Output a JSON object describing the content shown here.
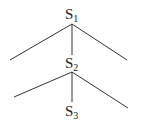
{
  "diagram": {
    "type": "tree",
    "nodes": [
      {
        "id": "S1",
        "base": "S",
        "sub": "1"
      },
      {
        "id": "S2",
        "base": "S",
        "sub": "2"
      },
      {
        "id": "S3",
        "base": "S",
        "sub": "3"
      }
    ],
    "edges": [
      {
        "from": "S1",
        "to": "left-leaf"
      },
      {
        "from": "S1",
        "to": "S2"
      },
      {
        "from": "S1",
        "to": "right-leaf"
      },
      {
        "from": "S2",
        "to": "left-leaf"
      },
      {
        "from": "S2",
        "to": "S3"
      },
      {
        "from": "S2",
        "to": "right-leaf"
      }
    ],
    "line_color": "#333333"
  }
}
